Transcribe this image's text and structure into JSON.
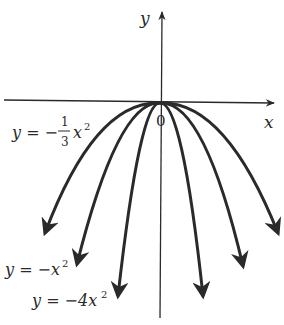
{
  "figure": {
    "axes": {
      "x_label": "x",
      "y_label": "y",
      "origin_label": "0"
    },
    "curves": [
      {
        "name": "y = -1/3 x^2",
        "a": -0.3333
      },
      {
        "name": "y = -x^2",
        "a": -1
      },
      {
        "name": "y = -4x^2",
        "a": -4
      }
    ],
    "labels": {
      "third_prefix": "y = −",
      "third_num": "1",
      "third_den": "3",
      "third_var": "x",
      "third_exp": "2",
      "one_text": "y = −x",
      "one_exp": "2",
      "four_text": "y = −4x",
      "four_exp": "2"
    },
    "colors": {
      "ink": "#2a2a2a"
    }
  }
}
